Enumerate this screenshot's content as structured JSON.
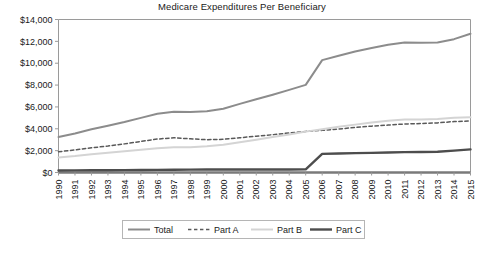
{
  "chart_data": {
    "type": "line",
    "title": "Medicare Expenditures Per Beneficiary",
    "xlabel": "",
    "ylabel": "",
    "ylim": [
      0,
      14000
    ],
    "ytick_values": [
      0,
      2000,
      4000,
      6000,
      8000,
      10000,
      12000,
      14000
    ],
    "ytick_labels": [
      "$0",
      "$2,000",
      "$4,000",
      "$6,000",
      "$8,000",
      "$10,000",
      "$12,000",
      "$14,000"
    ],
    "grid": false,
    "legend_position": "bottom",
    "categories": [
      "1990",
      "1991",
      "1992",
      "1993",
      "1994",
      "1995",
      "1996",
      "1997",
      "1998",
      "1999",
      "2000",
      "2001",
      "2002",
      "2003",
      "2004",
      "2005",
      "2006",
      "2007",
      "2008",
      "2009",
      "2010",
      "2011",
      "2012",
      "2013",
      "2014",
      "2015"
    ],
    "series": [
      {
        "name": "Total",
        "color": "#8c8c8c",
        "style": "solid",
        "width": 2.0,
        "values": [
          3240,
          3560,
          3950,
          4280,
          4620,
          5000,
          5380,
          5560,
          5530,
          5600,
          5840,
          6280,
          6700,
          7120,
          7560,
          8020,
          10280,
          10680,
          11080,
          11400,
          11680,
          11900,
          11880,
          11900,
          12200,
          12700
        ]
      },
      {
        "name": "Part A",
        "color": "#595959",
        "style": "dashed",
        "width": 1.5,
        "values": [
          1900,
          2060,
          2260,
          2420,
          2620,
          2840,
          3060,
          3180,
          3080,
          3000,
          3040,
          3180,
          3320,
          3460,
          3620,
          3760,
          3860,
          3980,
          4120,
          4240,
          4340,
          4440,
          4480,
          4540,
          4660,
          4720
        ]
      },
      {
        "name": "Part B",
        "color": "#d4d4d4",
        "style": "solid",
        "width": 2.0,
        "values": [
          1380,
          1500,
          1660,
          1800,
          1940,
          2080,
          2220,
          2300,
          2320,
          2400,
          2540,
          2760,
          3000,
          3240,
          3480,
          3740,
          3960,
          4180,
          4380,
          4580,
          4740,
          4840,
          4860,
          4900,
          5000,
          5060
        ]
      },
      {
        "name": "Part C",
        "color": "#4d4d4d",
        "style": "solid",
        "width": 2.4,
        "values": [
          180,
          190,
          200,
          210,
          220,
          230,
          240,
          250,
          260,
          270,
          280,
          280,
          280,
          280,
          280,
          290,
          1700,
          1740,
          1770,
          1800,
          1830,
          1860,
          1880,
          1900,
          2000,
          2120
        ]
      }
    ],
    "legend_entries": [
      {
        "label": "Total",
        "color": "#8c8c8c",
        "style": "solid",
        "width": 2.0
      },
      {
        "label": "Part A",
        "color": "#595959",
        "style": "dashed",
        "width": 1.5
      },
      {
        "label": "Part B",
        "color": "#d4d4d4",
        "style": "solid",
        "width": 2.0
      },
      {
        "label": "Part C",
        "color": "#4d4d4d",
        "style": "solid",
        "width": 2.4
      }
    ],
    "colors": {
      "axis": "#9a9a9a",
      "baseline": "#7a7a7a",
      "text": "#1a1a1a",
      "legend_border": "#b5b5b5",
      "plot_background": "#ffffff"
    }
  }
}
